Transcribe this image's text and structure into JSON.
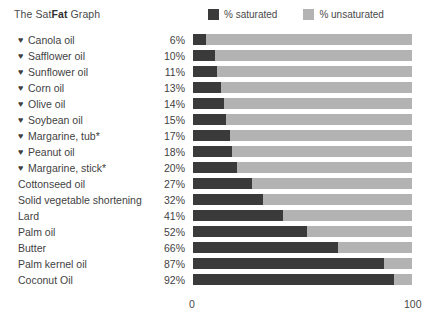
{
  "title": {
    "prefix": "The Sat",
    "bold": "Fat",
    "suffix": " Graph"
  },
  "legend": {
    "saturated": "% saturated",
    "unsaturated": "% unsaturated",
    "saturated_color": "#3a3a3a",
    "unsaturated_color": "#b3b3b3"
  },
  "axis": {
    "min_label": "0",
    "max_label": "100"
  },
  "chart_data": {
    "type": "bar",
    "orientation": "horizontal",
    "stacked": true,
    "title": "The SatFat Graph",
    "xlabel": "",
    "ylabel": "",
    "xlim": [
      0,
      100
    ],
    "grid": false,
    "legend_position": "top-right",
    "categories": [
      "Canola oil",
      "Safflower oil",
      "Sunflower oil",
      "Corn oil",
      "Olive oil",
      "Soybean oil",
      "Margarine, tub*",
      "Peanut oil",
      "Margarine, stick*",
      "Cottonseed oil",
      "Solid vegetable shortening",
      "Lard",
      "Palm oil",
      "Butter",
      "Palm kernel oil",
      "Coconut Oil"
    ],
    "series": [
      {
        "name": "% saturated",
        "color": "#3a3a3a",
        "values": [
          6,
          10,
          11,
          13,
          14,
          15,
          17,
          18,
          20,
          27,
          32,
          41,
          52,
          66,
          87,
          92
        ]
      },
      {
        "name": "% unsaturated",
        "color": "#b3b3b3",
        "values": [
          94,
          90,
          89,
          87,
          86,
          85,
          83,
          82,
          80,
          73,
          68,
          59,
          48,
          34,
          13,
          8
        ]
      }
    ],
    "value_labels": [
      "6%",
      "10%",
      "11%",
      "13%",
      "14%",
      "15%",
      "17%",
      "18%",
      "20%",
      "27%",
      "32%",
      "41%",
      "52%",
      "66%",
      "87%",
      "92%"
    ],
    "heart_marked": [
      true,
      true,
      true,
      true,
      true,
      true,
      true,
      true,
      true,
      false,
      false,
      false,
      false,
      false,
      false,
      false
    ],
    "heart_glyph": "♥",
    "annotations": [
      "* Margarine entries are marked with an asterisk"
    ]
  }
}
